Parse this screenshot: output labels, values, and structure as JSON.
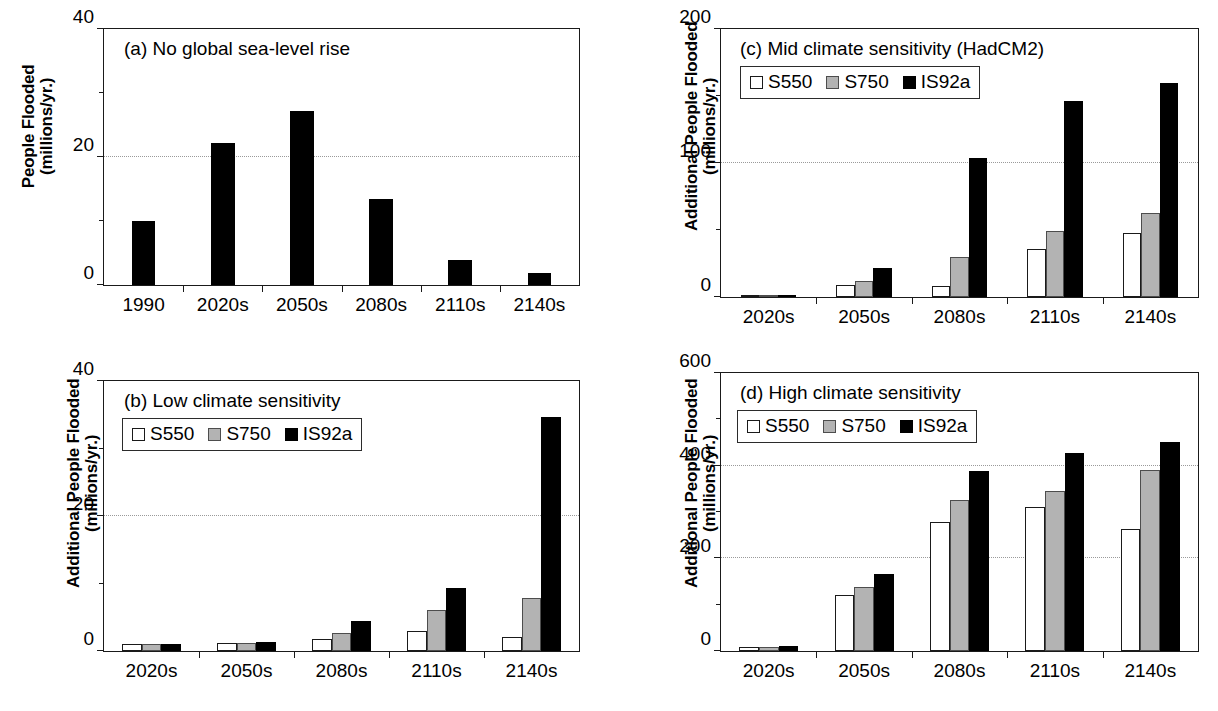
{
  "figure": {
    "panel_count": 4,
    "series_names": [
      "S550",
      "S750",
      "IS92a"
    ],
    "series_colors": {
      "S550": "#ffffff",
      "S750": "#b3b3b3",
      "IS92a": "#000000"
    }
  },
  "legend": {
    "s550_label": "S550",
    "s750_label": "S750",
    "is92a_label": "IS92a"
  },
  "panel_a": {
    "caption": "(a) No global sea-level rise",
    "ylabel_line1": "People Flooded",
    "ylabel_line2": "(millions/yr.)",
    "yticks": [
      "0",
      "20",
      "40"
    ],
    "xticks": [
      "1990",
      "2020s",
      "2050s",
      "2080s",
      "2110s",
      "2140s"
    ]
  },
  "panel_b": {
    "caption": "(b) Low climate sensitivity",
    "ylabel_line1": "Additional People Flooded",
    "ylabel_line2": "(millions/yr.)",
    "yticks": [
      "0",
      "20",
      "40"
    ],
    "xticks": [
      "2020s",
      "2050s",
      "2080s",
      "2110s",
      "2140s"
    ]
  },
  "panel_c": {
    "caption": "(c) Mid climate sensitivity (HadCM2)",
    "ylabel_line1": "Additional People Flooded",
    "ylabel_line2": "(millions/yr.)",
    "yticks": [
      "0",
      "100",
      "200"
    ],
    "xticks": [
      "2020s",
      "2050s",
      "2080s",
      "2110s",
      "2140s"
    ]
  },
  "panel_d": {
    "caption": "(d) High climate sensitivity",
    "ylabel_line1": "Additional People Flooded",
    "ylabel_line2": "(millions/yr.)",
    "yticks": [
      "0",
      "200",
      "400",
      "600"
    ],
    "xticks": [
      "2020s",
      "2050s",
      "2080s",
      "2110s",
      "2140s"
    ]
  },
  "chart_data": [
    {
      "id": "panel_a",
      "type": "bar",
      "title": "(a) No global sea-level rise",
      "xlabel": "",
      "ylabel": "People Flooded (millions/yr.)",
      "ylim": [
        0,
        40
      ],
      "yticks_major": [
        0,
        20,
        40
      ],
      "yticks_minor": [
        10,
        30
      ],
      "gridlines": [
        20
      ],
      "grid": true,
      "legend": false,
      "categories": [
        "1990",
        "2020s",
        "2050s",
        "2080s",
        "2110s",
        "2140s"
      ],
      "series": [
        {
          "name": "People Flooded",
          "color": "#000000",
          "values": [
            10.0,
            22.2,
            27.2,
            13.5,
            3.9,
            1.8
          ]
        }
      ]
    },
    {
      "id": "panel_b",
      "type": "bar",
      "title": "(b) Low climate sensitivity",
      "xlabel": "",
      "ylabel": "Additional People Flooded (millions/yr.)",
      "ylim": [
        0,
        40
      ],
      "yticks_major": [
        0,
        20,
        40
      ],
      "yticks_minor": [
        10,
        30
      ],
      "gridlines": [
        20
      ],
      "grid": true,
      "legend": true,
      "legend_position": "upper-left",
      "categories": [
        "2020s",
        "2050s",
        "2080s",
        "2110s",
        "2140s"
      ],
      "series": [
        {
          "name": "S550",
          "color": "#ffffff",
          "values": [
            1.0,
            1.2,
            1.8,
            3.0,
            2.1
          ]
        },
        {
          "name": "S750",
          "color": "#b3b3b3",
          "values": [
            1.0,
            1.2,
            2.6,
            6.1,
            7.8
          ]
        },
        {
          "name": "IS92a",
          "color": "#000000",
          "values": [
            1.1,
            1.4,
            4.5,
            9.4,
            34.6
          ]
        }
      ]
    },
    {
      "id": "panel_c",
      "type": "bar",
      "title": "(c) Mid climate sensitivity (HadCM2)",
      "xlabel": "",
      "ylabel": "Additional People Flooded (millions/yr.)",
      "ylim": [
        0,
        200
      ],
      "yticks_major": [
        0,
        100,
        200
      ],
      "yticks_minor": [
        50,
        150
      ],
      "gridlines": [
        100
      ],
      "grid": true,
      "legend": true,
      "legend_position": "upper-left",
      "categories": [
        "2020s",
        "2050s",
        "2080s",
        "2110s",
        "2140s"
      ],
      "series": [
        {
          "name": "S550",
          "color": "#ffffff",
          "values": [
            1.0,
            9.0,
            8.0,
            36.0,
            48.0
          ]
        },
        {
          "name": "S750",
          "color": "#b3b3b3",
          "values": [
            1.0,
            12.0,
            30.0,
            49.0,
            63.0
          ]
        },
        {
          "name": "IS92a",
          "color": "#000000",
          "values": [
            1.0,
            22.0,
            104.0,
            146.0,
            160.0
          ]
        }
      ]
    },
    {
      "id": "panel_d",
      "type": "bar",
      "title": "(d) High climate sensitivity",
      "xlabel": "",
      "ylabel": "Additional People Flooded (millions/yr.)",
      "ylim": [
        0,
        600
      ],
      "yticks_major": [
        0,
        200,
        400,
        600
      ],
      "yticks_minor": [
        100,
        300,
        500
      ],
      "gridlines": [
        200,
        400
      ],
      "grid": true,
      "legend": true,
      "legend_position": "upper-left",
      "categories": [
        "2020s",
        "2050s",
        "2080s",
        "2110s",
        "2140s"
      ],
      "series": [
        {
          "name": "S550",
          "color": "#ffffff",
          "values": [
            8.0,
            120.0,
            279.0,
            310.0,
            263.0
          ]
        },
        {
          "name": "S750",
          "color": "#b3b3b3",
          "values": [
            9.0,
            138.0,
            326.0,
            345.0,
            391.0
          ]
        },
        {
          "name": "IS92a",
          "color": "#000000",
          "values": [
            11.0,
            167.0,
            388.0,
            428.0,
            452.0
          ]
        }
      ]
    }
  ]
}
